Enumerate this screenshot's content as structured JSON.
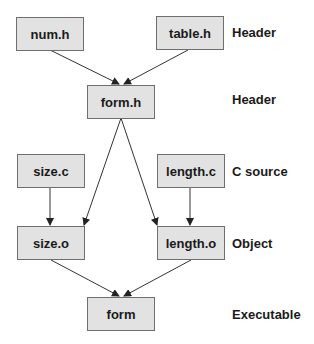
{
  "diagram": {
    "nodes": [
      {
        "id": "num_h",
        "label": "num.h"
      },
      {
        "id": "table_h",
        "label": "table.h"
      },
      {
        "id": "form_h",
        "label": "form.h"
      },
      {
        "id": "size_c",
        "label": "size.c"
      },
      {
        "id": "length_c",
        "label": "length.c"
      },
      {
        "id": "size_o",
        "label": "size.o"
      },
      {
        "id": "length_o",
        "label": "length.o"
      },
      {
        "id": "form",
        "label": "form"
      }
    ],
    "edges": [
      {
        "from": "num.h",
        "to": "form.h"
      },
      {
        "from": "table.h",
        "to": "form.h"
      },
      {
        "from": "form.h",
        "to": "size.o"
      },
      {
        "from": "form.h",
        "to": "length.o"
      },
      {
        "from": "size.c",
        "to": "size.o"
      },
      {
        "from": "length.c",
        "to": "length.o"
      },
      {
        "from": "size.o",
        "to": "form"
      },
      {
        "from": "length.o",
        "to": "form"
      }
    ],
    "row_labels": [
      {
        "text": "Header"
      },
      {
        "text": "Header"
      },
      {
        "text": "C source"
      },
      {
        "text": "Object"
      },
      {
        "text": "Executable"
      }
    ]
  }
}
